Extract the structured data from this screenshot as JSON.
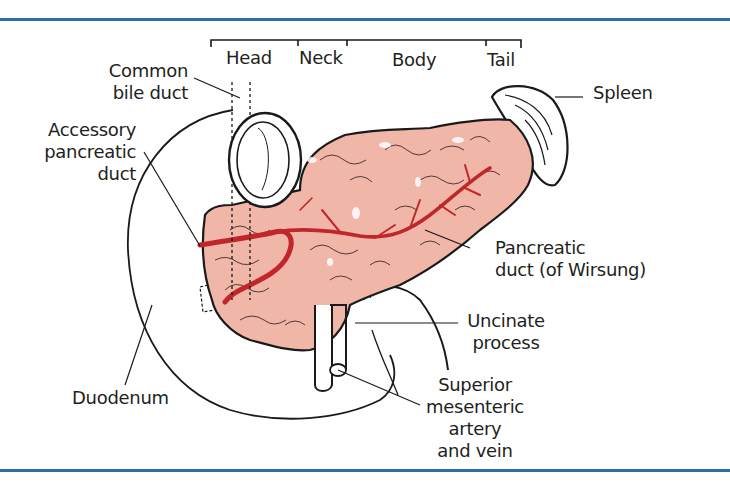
{
  "figure": {
    "rule_color": "#2f6ea5",
    "organ_fill": "#f0b7a8",
    "duct_color": "#c0262b",
    "outline_color": "#1a1a1a"
  },
  "regions": {
    "head": "Head",
    "neck": "Neck",
    "body": "Body",
    "tail": "Tail"
  },
  "labels": {
    "common_bile_duct": [
      "Common",
      "bile duct"
    ],
    "accessory_pancreatic_duct": [
      "Accessory",
      "pancreatic",
      "duct"
    ],
    "duodenum": "Duodenum",
    "spleen": "Spleen",
    "pancreatic_duct": [
      "Pancreatic",
      "duct (of Wirsung)"
    ],
    "uncinate_process": [
      "Uncinate",
      "process"
    ],
    "superior_mesenteric": [
      "Superior",
      "mesenteric",
      "artery",
      "and vein"
    ]
  }
}
